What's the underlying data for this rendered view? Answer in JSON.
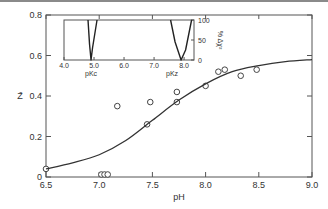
{
  "chart_data": {
    "type": "scatter",
    "title": "",
    "xlabel": "pH",
    "ylabel": "Z̄",
    "xlim": [
      6.5,
      9.0
    ],
    "ylim": [
      0,
      0.8
    ],
    "x_ticks": [
      "6.5",
      "7.0",
      "7.5",
      "8.0",
      "8.5",
      "9.0"
    ],
    "y_ticks": [
      "0",
      "0.2",
      "0.4",
      "0.6",
      "0.8"
    ],
    "grid": false,
    "series": [
      {
        "name": "observed",
        "kind": "scatter",
        "marker": "open-circle",
        "points": [
          [
            6.5,
            0.04
          ],
          [
            7.02,
            0.0
          ],
          [
            7.05,
            0.0
          ],
          [
            7.08,
            0.0
          ],
          [
            7.17,
            0.35
          ],
          [
            7.45,
            0.26
          ],
          [
            7.48,
            0.37
          ],
          [
            7.73,
            0.37
          ],
          [
            7.73,
            0.42
          ],
          [
            8.0,
            0.45
          ],
          [
            8.12,
            0.52
          ],
          [
            8.18,
            0.53
          ],
          [
            8.33,
            0.5
          ],
          [
            8.48,
            0.53
          ]
        ]
      },
      {
        "name": "fit",
        "kind": "line",
        "points": [
          [
            6.5,
            0.04
          ],
          [
            6.75,
            0.07
          ],
          [
            7.0,
            0.11
          ],
          [
            7.25,
            0.18
          ],
          [
            7.5,
            0.28
          ],
          [
            7.75,
            0.38
          ],
          [
            8.0,
            0.46
          ],
          [
            8.25,
            0.52
          ],
          [
            8.5,
            0.55
          ],
          [
            8.75,
            0.57
          ],
          [
            9.0,
            0.58
          ]
        ]
      }
    ],
    "inset": {
      "type": "line",
      "xlim": [
        4.0,
        8.33
      ],
      "ylim": [
        0,
        100
      ],
      "x_ticks": [
        "4.0",
        "5.0",
        "6.0",
        "7.0",
        "8.0"
      ],
      "y_ticks": [
        "0",
        "50",
        "100"
      ],
      "ylabel": "% Δχ²",
      "annotations": [
        "pKc",
        "pKz"
      ],
      "curves": [
        {
          "name": "pKc",
          "minimum_x": 4.9,
          "points": [
            [
              4.8,
              100
            ],
            [
              4.85,
              40
            ],
            [
              4.9,
              0
            ],
            [
              4.95,
              30
            ],
            [
              5.1,
              100
            ]
          ]
        },
        {
          "name": "pKz",
          "minimum_x": 7.9,
          "points": [
            [
              7.55,
              100
            ],
            [
              7.7,
              45
            ],
            [
              7.9,
              0
            ],
            [
              8.05,
              25
            ],
            [
              8.25,
              100
            ]
          ]
        }
      ]
    }
  },
  "labels": {
    "xlabel": "pH",
    "ylabel": "Z̄",
    "inset_ylabel": "% Δχ²",
    "inset_pkc": "pKc",
    "inset_pkz": "pKz"
  }
}
